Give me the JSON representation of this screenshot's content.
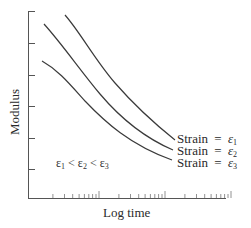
{
  "chart_data": {
    "type": "line",
    "title": "",
    "xlabel": "Log time",
    "ylabel": "Modulus",
    "x_scale": "log",
    "grid": false,
    "legend_position": "inline-right-end-of-curves",
    "y_ticks_count": 6,
    "x_decades": 3,
    "series": [
      {
        "name": "Strain = ε1",
        "label_text": "Strain",
        "epsilon": "ε",
        "subscript": "1",
        "points": [
          [
            65,
            16
          ],
          [
            90,
            48
          ],
          [
            120,
            90
          ],
          [
            150,
            120
          ],
          [
            175,
            140
          ]
        ]
      },
      {
        "name": "Strain = ε2",
        "label_text": "Strain",
        "epsilon": "ε",
        "subscript": "2",
        "points": [
          [
            44,
            24
          ],
          [
            75,
            60
          ],
          [
            105,
            100
          ],
          [
            140,
            133
          ],
          [
            175,
            151
          ]
        ]
      },
      {
        "name": "Strain = ε3",
        "label_text": "Strain",
        "epsilon": "ε",
        "subscript": "3",
        "points": [
          [
            42,
            61
          ],
          [
            60,
            75
          ],
          [
            90,
            107
          ],
          [
            130,
            143
          ],
          [
            173,
            160
          ]
        ]
      }
    ],
    "annotations": [
      {
        "text": "ε1 < ε2 < ε3"
      }
    ]
  },
  "labels": {
    "ylabel": "Modulus",
    "xlabel": "Log time",
    "equals": "=",
    "strain": "Strain",
    "eps": "ε",
    "lt": "<",
    "s1": "1",
    "s2": "2",
    "s3": "3"
  }
}
